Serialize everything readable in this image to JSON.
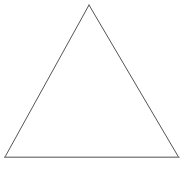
{
  "canvas": {
    "width": 189,
    "height": 173,
    "background_color": "#ffffff",
    "alt_text": "Isosceles triangle outline"
  },
  "figure": {
    "name": "triangle",
    "shape_type": "triangle",
    "fill_color": "#ffffff",
    "fill": "none",
    "stroke_color": "#555555",
    "stroke_width": 1,
    "vertices": [
      {
        "label": "apex",
        "x": 89,
        "y": 5
      },
      {
        "label": "bottom-right",
        "x": 178.5,
        "y": 157
      },
      {
        "label": "bottom-left",
        "x": 5,
        "y": 157
      }
    ],
    "points_attr": "89,5 178.5,157 5,157",
    "edges": [
      {
        "name": "left-edge",
        "from": "apex",
        "to": "bottom-left",
        "stroke_color": "#555555",
        "stroke_width": 1,
        "x1": 89,
        "y1": 5,
        "x2": 5,
        "y2": 157
      },
      {
        "name": "right-edge",
        "from": "apex",
        "to": "bottom-right",
        "stroke_color": "#555555",
        "stroke_width": 1,
        "x1": 89,
        "y1": 5,
        "x2": 178.5,
        "y2": 157
      },
      {
        "name": "base-edge",
        "from": "bottom-left",
        "to": "bottom-right",
        "stroke_color": "#8a8a8a",
        "stroke_width": 1.6,
        "x1": 4,
        "y1": 157.3,
        "x2": 179.5,
        "y2": 157.3
      }
    ]
  }
}
